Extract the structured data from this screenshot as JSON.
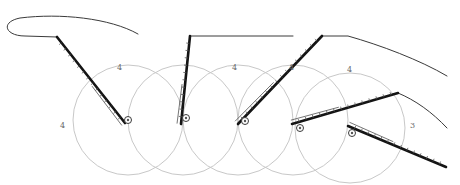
{
  "diagram": {
    "title": "Pencil sketch: lever rotating through five pivot positions",
    "colors": {
      "background": "#ffffff",
      "circle": "#c8c8c8",
      "lever": "#141414",
      "outline": "#3a3a3a",
      "hatch": "#555555",
      "label": "#6a6a6a"
    },
    "circle_radius": 55,
    "circles": [
      {
        "cx": 128,
        "cy": 120
      },
      {
        "cx": 183,
        "cy": 120
      },
      {
        "cx": 238,
        "cy": 120
      },
      {
        "cx": 293,
        "cy": 120
      },
      {
        "cx": 350,
        "cy": 128
      }
    ],
    "pivots": [
      {
        "x": 128,
        "y": 120
      },
      {
        "x": 186,
        "y": 118
      },
      {
        "x": 245,
        "y": 121
      },
      {
        "x": 300,
        "y": 128
      },
      {
        "x": 352,
        "y": 133
      }
    ],
    "levers": [
      {
        "x1": 57,
        "y1": 37,
        "x2": 125,
        "y2": 123
      },
      {
        "x1": 190,
        "y1": 36,
        "x2": 181,
        "y2": 124
      },
      {
        "x1": 322,
        "y1": 36,
        "x2": 238,
        "y2": 124
      },
      {
        "x1": 398,
        "y1": 93,
        "x2": 292,
        "y2": 124
      },
      {
        "x1": 446,
        "y1": 167,
        "x2": 348,
        "y2": 126
      }
    ],
    "outlines": [
      "M 57 37 L 25 36 C 5 36, 0 22, 20 18 C 60 13, 110 18, 138 34",
      "M 190 36 L 293 36",
      "M 322 36 L 348 36 C 380 45, 420 60, 447 76",
      "M 398 93 C 415 100, 432 112, 447 128"
    ],
    "labels": [
      {
        "text": "4",
        "x": 60,
        "y": 122
      },
      {
        "text": "4",
        "x": 117,
        "y": 64
      },
      {
        "text": "4",
        "x": 232,
        "y": 64
      },
      {
        "text": "4",
        "x": 289,
        "y": 64
      },
      {
        "text": "4",
        "x": 347,
        "y": 66
      },
      {
        "text": "3",
        "x": 410,
        "y": 122
      }
    ]
  }
}
